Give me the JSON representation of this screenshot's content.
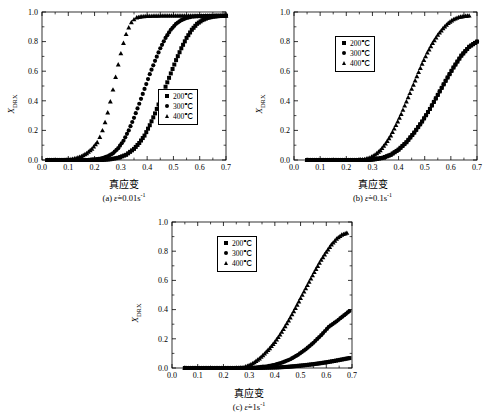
{
  "figure": {
    "y_axis_label": "X",
    "y_axis_label_sub": "DRX",
    "x_axis_label": "真应变",
    "legend_entries": [
      {
        "marker": "square",
        "label": "200℃"
      },
      {
        "marker": "circle",
        "label": "300℃"
      },
      {
        "marker": "triangle",
        "label": "400℃"
      }
    ]
  },
  "panels": {
    "a": {
      "caption_prefix": "(a) ",
      "caption_symbol": "ε̇",
      "caption_value": "=0.01s",
      "caption_exp": "-1"
    },
    "b": {
      "caption_prefix": "(b) ",
      "caption_symbol": "ε̇",
      "caption_value": "=0.1s",
      "caption_exp": "-1"
    },
    "c": {
      "caption_prefix": "(c) ",
      "caption_symbol": "ε̇",
      "caption_value": "=1s",
      "caption_exp": "-1"
    }
  },
  "chart_data": [
    {
      "id": "a",
      "type": "scatter",
      "title": "(a) strain rate = 0.01 s^-1",
      "xlabel": "真应变",
      "ylabel": "X_DRX",
      "xlim": [
        0.0,
        0.7
      ],
      "ylim": [
        0.0,
        1.0
      ],
      "xticks": [
        "0.0",
        "0.1",
        "0.2",
        "0.3",
        "0.4",
        "0.5",
        "0.6",
        "0.7"
      ],
      "yticks": [
        "0.0",
        "0.2",
        "0.4",
        "0.6",
        "0.8",
        "1.0"
      ],
      "grid": false,
      "legend_position": "lower-right",
      "series": [
        {
          "name": "200℃",
          "marker": "square",
          "x": [
            0.02,
            0.05,
            0.08,
            0.11,
            0.14,
            0.17,
            0.2,
            0.23,
            0.26,
            0.29,
            0.32,
            0.35,
            0.37,
            0.39,
            0.41,
            0.43,
            0.45,
            0.47,
            0.49,
            0.51,
            0.53,
            0.55,
            0.57,
            0.59,
            0.61,
            0.63,
            0.65,
            0.67,
            0.7
          ],
          "y": [
            0.0,
            0.0,
            0.0,
            0.0,
            0.0,
            0.0,
            0.0,
            0.0,
            0.005,
            0.015,
            0.035,
            0.075,
            0.115,
            0.165,
            0.235,
            0.315,
            0.405,
            0.495,
            0.585,
            0.675,
            0.755,
            0.825,
            0.88,
            0.92,
            0.945,
            0.96,
            0.968,
            0.972,
            0.975
          ]
        },
        {
          "name": "300℃",
          "marker": "circle",
          "x": [
            0.02,
            0.05,
            0.08,
            0.11,
            0.14,
            0.17,
            0.2,
            0.23,
            0.25,
            0.27,
            0.29,
            0.31,
            0.33,
            0.35,
            0.37,
            0.39,
            0.41,
            0.43,
            0.45,
            0.47,
            0.49,
            0.51,
            0.53,
            0.55,
            0.57,
            0.6,
            0.63,
            0.66,
            0.7
          ],
          "y": [
            0.0,
            0.0,
            0.0,
            0.0,
            0.0,
            0.0,
            0.005,
            0.012,
            0.025,
            0.045,
            0.08,
            0.13,
            0.2,
            0.285,
            0.38,
            0.48,
            0.58,
            0.67,
            0.755,
            0.825,
            0.88,
            0.92,
            0.945,
            0.96,
            0.968,
            0.972,
            0.974,
            0.975,
            0.975
          ]
        },
        {
          "name": "400℃",
          "marker": "triangle",
          "x": [
            0.02,
            0.05,
            0.08,
            0.11,
            0.13,
            0.15,
            0.17,
            0.19,
            0.21,
            0.22,
            0.23,
            0.24,
            0.25,
            0.26,
            0.27,
            0.28,
            0.29,
            0.3,
            0.31,
            0.32,
            0.33,
            0.34,
            0.35,
            0.36,
            0.38,
            0.41,
            0.45,
            0.5,
            0.55,
            0.6,
            0.65,
            0.7
          ],
          "y": [
            0.0,
            0.0,
            0.0,
            0.005,
            0.012,
            0.025,
            0.045,
            0.075,
            0.12,
            0.155,
            0.2,
            0.255,
            0.32,
            0.395,
            0.475,
            0.56,
            0.645,
            0.72,
            0.79,
            0.85,
            0.895,
            0.93,
            0.95,
            0.962,
            0.97,
            0.973,
            0.975,
            0.975,
            0.975,
            0.975,
            0.975,
            0.975
          ]
        }
      ]
    },
    {
      "id": "b",
      "type": "scatter",
      "title": "(b) strain rate = 0.1 s^-1",
      "xlabel": "真应变",
      "ylabel": "X_DRX",
      "xlim": [
        0.0,
        0.7
      ],
      "ylim": [
        0.0,
        1.0
      ],
      "xticks": [
        "0.0",
        "0.1",
        "0.2",
        "0.3",
        "0.4",
        "0.5",
        "0.6",
        "0.7"
      ],
      "yticks": [
        "0.0",
        "0.2",
        "0.4",
        "0.6",
        "0.8",
        "1.0"
      ],
      "grid": false,
      "legend_position": "upper-left",
      "series": [
        {
          "name": "200℃",
          "marker": "square",
          "x": [
            0.05,
            0.1,
            0.15,
            0.2,
            0.25,
            0.28,
            0.31,
            0.34,
            0.37,
            0.4,
            0.43,
            0.46,
            0.49,
            0.52,
            0.55,
            0.58,
            0.61,
            0.64,
            0.67,
            0.7
          ],
          "y": [
            0.0,
            0.0,
            0.0,
            0.0,
            0.0,
            0.0,
            0.005,
            0.015,
            0.035,
            0.07,
            0.12,
            0.185,
            0.26,
            0.345,
            0.44,
            0.535,
            0.625,
            0.705,
            0.765,
            0.8
          ]
        },
        {
          "name": "300℃",
          "marker": "circle",
          "x": [
            0.05,
            0.1,
            0.15,
            0.2,
            0.25,
            0.28,
            0.31,
            0.34,
            0.37,
            0.4,
            0.43,
            0.46,
            0.49,
            0.52,
            0.55,
            0.58,
            0.61,
            0.64,
            0.67,
            0.7
          ],
          "y": [
            0.0,
            0.0,
            0.0,
            0.0,
            0.0,
            0.0,
            0.005,
            0.015,
            0.035,
            0.07,
            0.12,
            0.185,
            0.26,
            0.345,
            0.44,
            0.535,
            0.625,
            0.705,
            0.765,
            0.8
          ]
        },
        {
          "name": "400℃",
          "marker": "triangle",
          "x": [
            0.05,
            0.1,
            0.15,
            0.2,
            0.24,
            0.27,
            0.29,
            0.31,
            0.33,
            0.35,
            0.37,
            0.39,
            0.41,
            0.43,
            0.45,
            0.47,
            0.49,
            0.51,
            0.53,
            0.55,
            0.57,
            0.59,
            0.61,
            0.63,
            0.65,
            0.67
          ],
          "y": [
            0.0,
            0.0,
            0.0,
            0.0,
            0.0,
            0.005,
            0.015,
            0.035,
            0.065,
            0.11,
            0.165,
            0.235,
            0.31,
            0.395,
            0.48,
            0.565,
            0.65,
            0.725,
            0.79,
            0.845,
            0.89,
            0.925,
            0.95,
            0.965,
            0.972,
            0.975
          ]
        }
      ]
    },
    {
      "id": "c",
      "type": "scatter",
      "title": "(c) strain rate = 1 s^-1",
      "xlabel": "真应变",
      "ylabel": "X_DRX",
      "xlim": [
        0.0,
        0.7
      ],
      "ylim": [
        0.0,
        1.0
      ],
      "xticks": [
        "0.0",
        "0.1",
        "0.2",
        "0.3",
        "0.4",
        "0.5",
        "0.6",
        "0.7"
      ],
      "yticks": [
        "0.0",
        "0.2",
        "0.4",
        "0.6",
        "0.8",
        "1.0"
      ],
      "grid": false,
      "legend_position": "upper-center",
      "series": [
        {
          "name": "200℃",
          "marker": "square",
          "x": [
            0.05,
            0.1,
            0.15,
            0.2,
            0.25,
            0.29,
            0.33,
            0.37,
            0.41,
            0.45,
            0.48,
            0.51,
            0.54,
            0.57,
            0.6,
            0.63,
            0.66,
            0.69
          ],
          "y": [
            0.0,
            0.0,
            0.0,
            0.0,
            0.0,
            0.0,
            0.0,
            0.002,
            0.004,
            0.008,
            0.013,
            0.018,
            0.024,
            0.031,
            0.039,
            0.048,
            0.058,
            0.068
          ]
        },
        {
          "name": "300℃",
          "marker": "circle",
          "x": [
            0.05,
            0.1,
            0.15,
            0.2,
            0.25,
            0.29,
            0.33,
            0.37,
            0.4,
            0.43,
            0.46,
            0.49,
            0.52,
            0.55,
            0.58,
            0.61,
            0.64,
            0.67,
            0.69
          ],
          "y": [
            0.0,
            0.0,
            0.0,
            0.0,
            0.0,
            0.0,
            0.004,
            0.012,
            0.022,
            0.038,
            0.06,
            0.09,
            0.128,
            0.173,
            0.225,
            0.282,
            0.32,
            0.362,
            0.39
          ]
        },
        {
          "name": "400℃",
          "marker": "triangle",
          "x": [
            0.05,
            0.1,
            0.15,
            0.2,
            0.25,
            0.28,
            0.3,
            0.32,
            0.34,
            0.36,
            0.38,
            0.4,
            0.42,
            0.44,
            0.46,
            0.48,
            0.5,
            0.52,
            0.54,
            0.56,
            0.58,
            0.6,
            0.62,
            0.64,
            0.66,
            0.68
          ],
          "y": [
            0.0,
            0.0,
            0.0,
            0.0,
            0.0,
            0.005,
            0.018,
            0.038,
            0.065,
            0.098,
            0.135,
            0.178,
            0.228,
            0.285,
            0.345,
            0.41,
            0.478,
            0.545,
            0.612,
            0.678,
            0.74,
            0.795,
            0.845,
            0.885,
            0.912,
            0.925
          ]
        }
      ]
    }
  ]
}
